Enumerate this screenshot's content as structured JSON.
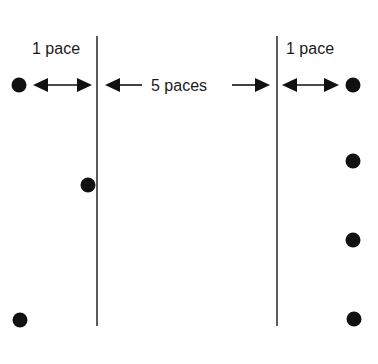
{
  "diagram": {
    "labels": {
      "left_gap": "1 pace",
      "middle_gap": "5 paces",
      "right_gap": "1 pace"
    },
    "colors": {
      "ink": "#111111",
      "line": "#333333",
      "background": "#ffffff"
    },
    "lines": [
      {
        "name": "left-line",
        "x": 97,
        "y1": 36,
        "y2": 326
      },
      {
        "name": "right-line",
        "x": 277,
        "y1": 36,
        "y2": 326
      }
    ],
    "dots": [
      {
        "name": "dot-left-top",
        "x": 19,
        "y": 85
      },
      {
        "name": "dot-left-middle",
        "x": 88,
        "y": 185
      },
      {
        "name": "dot-left-bottom",
        "x": 20,
        "y": 320
      },
      {
        "name": "dot-right-top",
        "x": 353,
        "y": 85
      },
      {
        "name": "dot-right-2",
        "x": 353,
        "y": 161
      },
      {
        "name": "dot-right-3",
        "x": 353,
        "y": 240
      },
      {
        "name": "dot-right-bottom",
        "x": 354,
        "y": 319
      }
    ]
  }
}
